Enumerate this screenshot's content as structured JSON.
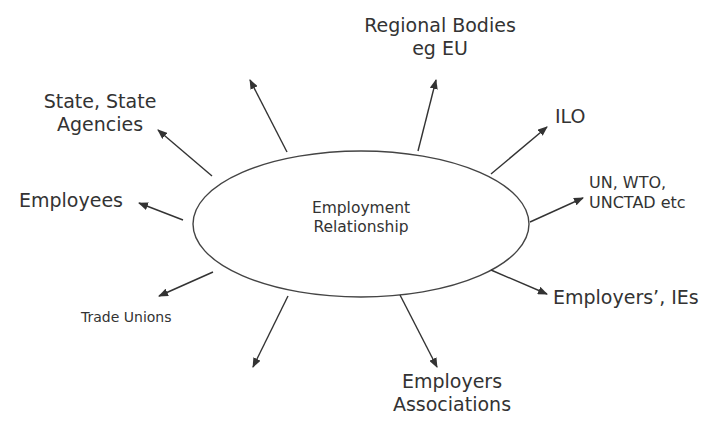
{
  "diagram": {
    "title": "Employment Relationship",
    "center": {
      "line1": "Employment",
      "line2": "Relationship"
    },
    "nodes": [
      {
        "id": "regional-bodies",
        "line1": "Regional Bodies",
        "line2": "eg EU"
      },
      {
        "id": "ilo",
        "line1": "ILO"
      },
      {
        "id": "un-wto-unctad",
        "line1": "UN, WTO,",
        "line2": "UNCTAD etc"
      },
      {
        "id": "employers-ies",
        "line1": "Employers’, IEs"
      },
      {
        "id": "employers-associations",
        "line1": "Employers",
        "line2": "Associations"
      },
      {
        "id": "trade-unions",
        "line1": "Trade Unions"
      },
      {
        "id": "employees",
        "line1": "Employees"
      },
      {
        "id": "state-agencies",
        "line1": "State, State",
        "line2": "Agencies"
      }
    ],
    "unlabeled_arrows": 2,
    "colors": {
      "stroke": "#333333",
      "text": "#333333",
      "background": "#ffffff"
    }
  }
}
